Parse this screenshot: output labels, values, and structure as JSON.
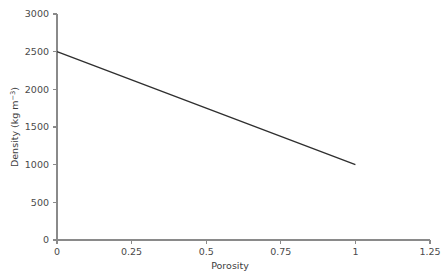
{
  "chart_data": {
    "type": "line",
    "title": "",
    "subtitle": "",
    "xlabel": "Porosity",
    "ylabel": "Density (kg m−3)",
    "ylabel_base": "Density (kg m",
    "ylabel_sup": "−3",
    "ylabel_close": ")",
    "xlim": [
      0,
      1.25
    ],
    "ylim": [
      0,
      3000
    ],
    "xticks": [
      0,
      0.25,
      0.5,
      0.75,
      1,
      1.25
    ],
    "xticklabels": [
      "0",
      "0.25",
      "0.5",
      "0.75",
      "1",
      "1.25"
    ],
    "yticks": [
      0,
      500,
      1000,
      1500,
      2000,
      2500,
      3000
    ],
    "yticklabels": [
      "0",
      "500",
      "1000",
      "1500",
      "2000",
      "2500",
      "3000"
    ],
    "grid": false,
    "legend": null,
    "annotations": [],
    "series": [
      {
        "name": "Density vs porosity",
        "color": "#2f2f2f",
        "x": [
          0,
          0.25,
          0.5,
          0.75,
          1
        ],
        "values": [
          2500,
          2125,
          1750,
          1375,
          1000
        ]
      }
    ],
    "axis_color": "#8a8a8a",
    "background": "#ffffff"
  }
}
